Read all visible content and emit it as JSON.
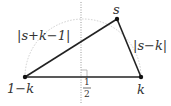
{
  "diagram": {
    "points": {
      "left": {
        "label": "1−k",
        "x": 25,
        "y": 77
      },
      "right": {
        "label": "k",
        "x": 141,
        "y": 77
      },
      "top": {
        "label": "s",
        "x": 117,
        "y": 19
      }
    },
    "edges": {
      "left_top": {
        "label": "|s+k−1|"
      },
      "top_right": {
        "label": "|s−k|"
      },
      "base": {
        "label": ""
      }
    },
    "midline": {
      "label_num": "1",
      "label_den": "2",
      "x": 81
    },
    "colors": {
      "edge": "#222222",
      "arc": "#c8c8c8",
      "midline": "#999999"
    }
  }
}
